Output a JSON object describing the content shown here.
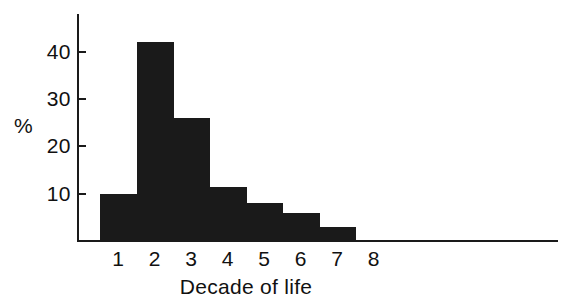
{
  "chart_data": {
    "type": "bar",
    "title": "",
    "subtitle": "",
    "xlabel": "Decade of life",
    "ylabel": "%",
    "categories": [
      "1",
      "2",
      "3",
      "4",
      "5",
      "6",
      "7"
    ],
    "values": [
      10,
      42,
      26,
      11.5,
      8,
      6,
      3
    ],
    "series": [
      {
        "name": "Percentage of cases",
        "values": [
          10,
          42,
          26,
          11.5,
          8,
          6,
          3
        ]
      }
    ],
    "x_tick_labels": [
      "1",
      "2",
      "3",
      "4",
      "5",
      "6",
      "7",
      "8"
    ],
    "y_tick_labels": [
      "10",
      "20",
      "30",
      "40"
    ],
    "y_tick_values": [
      10,
      20,
      30,
      40
    ],
    "ylim": [
      0,
      48
    ],
    "xlim": [
      0.5,
      8.5
    ],
    "grid": false,
    "legend": false,
    "legend_position": "none",
    "bar_color": "#1a1a1a",
    "axis_color": "#1a1a1a",
    "background_color": "#ffffff",
    "bar_gap": 0
  },
  "axes": {
    "x_title": "Decade of life",
    "y_title": "%"
  }
}
